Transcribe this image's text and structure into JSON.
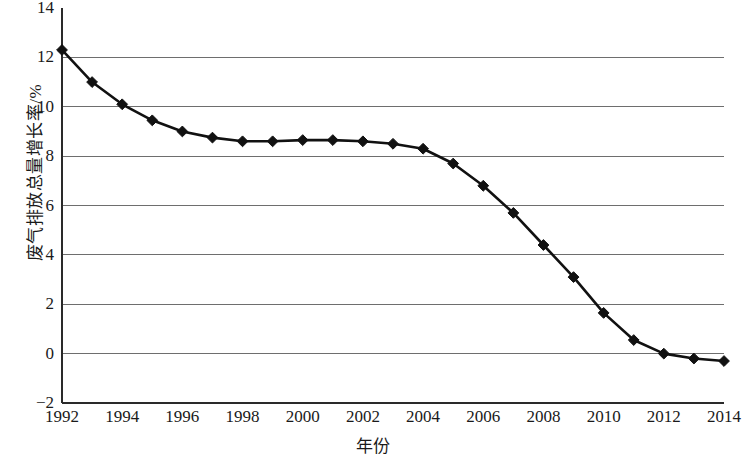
{
  "chart_data": {
    "type": "line",
    "title": "",
    "xlabel": "年份",
    "ylabel": "废气排放总量增长率/%",
    "xlim": [
      1992,
      2014
    ],
    "ylim": [
      -2,
      14
    ],
    "grid": true,
    "legend": "none",
    "marker": "diamond",
    "series_color": "#111111",
    "gridline_color": "#6e6e6e",
    "y_ticks": [
      "14",
      "12",
      "10",
      "8",
      "6",
      "4",
      "2",
      "0",
      "−2"
    ],
    "y_tick_values": [
      14,
      12,
      10,
      8,
      6,
      4,
      2,
      0,
      -2
    ],
    "x_ticks": [
      "1992",
      "1994",
      "1996",
      "1998",
      "2000",
      "2002",
      "2004",
      "2006",
      "2008",
      "2010",
      "2012",
      "2014"
    ],
    "x_tick_values": [
      1992,
      1994,
      1996,
      1998,
      2000,
      2002,
      2004,
      2006,
      2008,
      2010,
      2012,
      2014
    ],
    "x": [
      1992,
      1993,
      1994,
      1995,
      1996,
      1997,
      1998,
      1999,
      2000,
      2001,
      2002,
      2003,
      2004,
      2005,
      2006,
      2007,
      2008,
      2009,
      2010,
      2011,
      2012,
      2013,
      2014
    ],
    "values": [
      12.3,
      11.0,
      10.1,
      9.45,
      9.0,
      8.75,
      8.6,
      8.6,
      8.65,
      8.65,
      8.6,
      8.5,
      8.3,
      7.7,
      6.8,
      5.7,
      4.4,
      3.1,
      1.65,
      0.55,
      0.0,
      -0.2,
      -0.3
    ],
    "series": [
      {
        "name": "废气排放总量增长率",
        "values": [
          12.3,
          11.0,
          10.1,
          9.45,
          9.0,
          8.75,
          8.6,
          8.6,
          8.65,
          8.65,
          8.6,
          8.5,
          8.3,
          7.7,
          6.8,
          5.7,
          4.4,
          3.1,
          1.65,
          0.55,
          0.0,
          -0.2,
          -0.3
        ]
      }
    ]
  }
}
